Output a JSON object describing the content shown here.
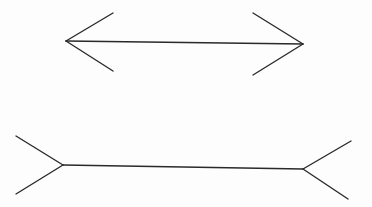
{
  "diagram": {
    "type": "muller-lyer-illusion",
    "stroke_color": "#2a2a2a",
    "background": "#ffffff",
    "figures": [
      {
        "name": "arrowheads-inward",
        "shaft": {
          "x1": 66,
          "y1": 41,
          "x2": 303,
          "y2": 44
        },
        "left_fins": [
          {
            "x1": 66,
            "y1": 41,
            "x2": 113,
            "y2": 13
          },
          {
            "x1": 66,
            "y1": 41,
            "x2": 113,
            "y2": 71
          }
        ],
        "right_fins": [
          {
            "x1": 303,
            "y1": 44,
            "x2": 253,
            "y2": 13
          },
          {
            "x1": 303,
            "y1": 44,
            "x2": 253,
            "y2": 75
          }
        ]
      },
      {
        "name": "arrowheads-outward",
        "shaft": {
          "x1": 63,
          "y1": 165,
          "x2": 303,
          "y2": 169
        },
        "left_fins": [
          {
            "x1": 63,
            "y1": 165,
            "x2": 16,
            "y2": 136
          },
          {
            "x1": 63,
            "y1": 165,
            "x2": 16,
            "y2": 194
          }
        ],
        "right_fins": [
          {
            "x1": 303,
            "y1": 169,
            "x2": 351,
            "y2": 141
          },
          {
            "x1": 303,
            "y1": 169,
            "x2": 348,
            "y2": 199
          }
        ]
      }
    ]
  }
}
